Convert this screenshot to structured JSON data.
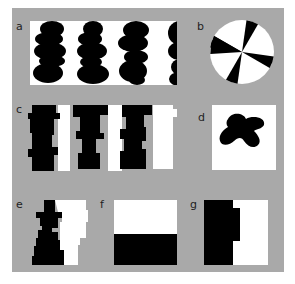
{
  "figure": {
    "background": "#a9a9a9",
    "foreground": "#000000",
    "panel_fill": "#ffffff",
    "panels": [
      {
        "id": "a",
        "label": "a",
        "description": "four vertical columns of stacked black blob shapes on white"
      },
      {
        "id": "b",
        "label": "b",
        "description": "circle divided into eight alternating black and white wedges"
      },
      {
        "id": "c",
        "label": "c",
        "description": "alternating black and white jagged vertical stripes"
      },
      {
        "id": "d",
        "label": "d",
        "description": "single irregular black blob on white square"
      },
      {
        "id": "e",
        "label": "e",
        "description": "black jagged silhouette on left, white jagged region on right"
      },
      {
        "id": "f",
        "label": "f",
        "description": "rectangle split horizontally, white top, black bottom"
      },
      {
        "id": "g",
        "label": "g",
        "description": "rectangle split vertically, black left with small step, white right"
      }
    ]
  }
}
